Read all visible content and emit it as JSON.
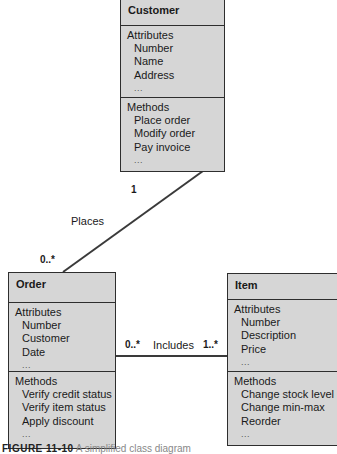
{
  "diagram": {
    "type": "UML class diagram",
    "classes": {
      "customer": {
        "name": "Customer",
        "attributes_label": "Attributes",
        "attributes": [
          "Number",
          "Name",
          "Address"
        ],
        "attributes_more": "...",
        "methods_label": "Methods",
        "methods": [
          "Place order",
          "Modify order",
          "Pay invoice"
        ],
        "methods_more": "..."
      },
      "order": {
        "name": "Order",
        "attributes_label": "Attributes",
        "attributes": [
          "Number",
          "Customer",
          "Date"
        ],
        "attributes_more": "...",
        "methods_label": "Methods",
        "methods": [
          "Verify credit status",
          "Verify item status",
          "Apply discount"
        ],
        "methods_more": "..."
      },
      "item": {
        "name": "Item",
        "attributes_label": "Attributes",
        "attributes": [
          "Number",
          "Description",
          "Price"
        ],
        "attributes_more": "...",
        "methods_label": "Methods",
        "methods": [
          "Change stock level",
          "Change min-max",
          "Reorder"
        ],
        "methods_more": "..."
      }
    },
    "associations": {
      "places": {
        "label": "Places",
        "from": "Customer",
        "to": "Order",
        "customer_multiplicity": "1",
        "order_multiplicity": "0..*"
      },
      "includes": {
        "label": "Includes",
        "from": "Order",
        "to": "Item",
        "order_multiplicity": "0..*",
        "item_multiplicity": "1..*"
      }
    },
    "caption": {
      "figure": "FIGURE 11-10",
      "rest": "A simplified class diagram"
    },
    "colors": {
      "box_fill": "#d6d6d6",
      "border": "#2e2e2e",
      "line": "#3a3a3a"
    }
  }
}
